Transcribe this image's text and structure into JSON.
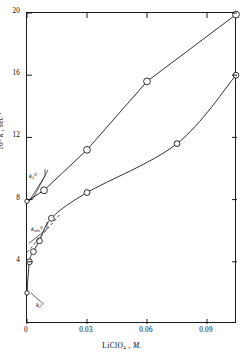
{
  "chart_data": {
    "type": "scatter",
    "title": "",
    "xlabel": "LiClO4 , M.",
    "ylabel": "10^3 k , sec^-1",
    "xlim": [
      0,
      0.105
    ],
    "ylim": [
      0,
      20
    ],
    "grid": false,
    "legend": "none",
    "xticks": [
      0,
      0.03,
      0.06,
      0.09
    ],
    "xtick_labels": [
      "0",
      "0.03",
      "0.06",
      "0.09"
    ],
    "yticks": [
      4,
      8,
      12,
      16,
      20
    ],
    "ytick_labels": [
      "4",
      "8",
      "12",
      "16",
      "20"
    ],
    "series": [
      {
        "name": "k1",
        "style": "open-circle-solid-line",
        "x": [
          0.0,
          0.0085,
          0.03,
          0.06,
          0.1045
        ],
        "y": [
          7.9,
          8.6,
          11.2,
          15.6,
          19.9
        ]
      },
      {
        "name": "k_obs",
        "style": "open-circle-curve",
        "x": [
          0.0,
          0.0012,
          0.0032,
          0.0062,
          0.0122,
          0.03,
          0.075,
          0.1045
        ],
        "y": [
          2.0,
          4.0,
          4.65,
          5.35,
          6.8,
          8.45,
          11.6,
          16.0
        ]
      }
    ],
    "dashed_guide": {
      "name": "k_obs-initial-slope",
      "x": [
        0.0,
        0.0165
      ],
      "y": [
        4.6,
        7.05
      ]
    },
    "annotations": [
      {
        "id": "k1-zero",
        "label_html": "k<sub>1</sub><sup>0</sup>",
        "value_y": 7.9
      },
      {
        "id": "kobs-zero",
        "label_html": "k<sub>obs</sub><sup>0</sup>",
        "value_y": 5.2
      },
      {
        "id": "k2-zero",
        "label_html": "k<sub>2</sub><sup>0</sup>",
        "value_y": 2.0
      }
    ],
    "axis_label_parts": {
      "y_prefix": "10",
      "y_exp": "3",
      "y_symbol": "k",
      "y_unit": "sec",
      "y_unit_exp": "-1",
      "x_formula": "LiClO",
      "x_formula_sub": "4",
      "x_unit": "M."
    }
  }
}
